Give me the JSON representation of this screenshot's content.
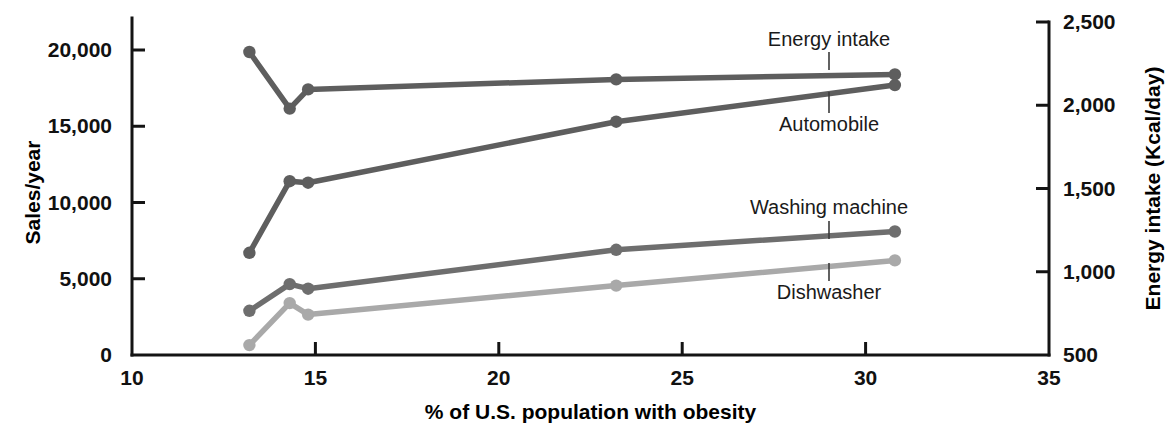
{
  "chart_data": {
    "type": "line",
    "title": "",
    "subtitle": "",
    "xlabel": "% of U.S. population with obesity",
    "ylabel": "Sales/year",
    "y2label": "Energy intake (Kcal/day)",
    "xlim": [
      10,
      35
    ],
    "ylim": [
      0,
      22000
    ],
    "y2lim": [
      500,
      2600
    ],
    "xticks": [
      "10",
      "15",
      "20",
      "25",
      "30",
      "35"
    ],
    "xtick_values": [
      10,
      15,
      20,
      25,
      30,
      35
    ],
    "yticks": [
      "0",
      "5,000",
      "10,000",
      "15,000",
      "20,000"
    ],
    "ytick_values": [
      0,
      5000,
      10000,
      15000,
      20000
    ],
    "y2ticks": [
      "500",
      "1,000",
      "1,500",
      "2,000",
      "2,500"
    ],
    "y2tick_values": [
      500,
      1000,
      1500,
      2000,
      2500
    ],
    "grid": false,
    "legend_position": "inline-annotations",
    "x": [
      13.2,
      14.3,
      14.8,
      23.2,
      30.8
    ],
    "series": [
      {
        "name": "Energy intake",
        "axis": "right",
        "color": "#5e5e5e",
        "label_x": 829,
        "label_y": 46,
        "label_anchor": "middle",
        "leader_from_y": 52,
        "leader_to_y": 70,
        "leader_x": 829,
        "values": [
          2320,
          1980,
          2095,
          2155,
          2185
        ]
      },
      {
        "name": "Automobile",
        "axis": "left",
        "color": "#5e5e5e",
        "label_x": 829,
        "label_y": 131,
        "label_anchor": "middle",
        "leader_from_y": 113,
        "leader_to_y": 92,
        "leader_x": 829,
        "values": [
          6700,
          11400,
          11300,
          15300,
          17700
        ]
      },
      {
        "name": "Washing machine",
        "axis": "left",
        "color": "#6e6e6e",
        "label_x": 829,
        "label_y": 214,
        "label_anchor": "middle",
        "leader_from_y": 221,
        "leader_to_y": 239,
        "leader_x": 829,
        "values": [
          2900,
          4650,
          4350,
          6900,
          8100
        ]
      },
      {
        "name": "Dishwasher",
        "axis": "left",
        "color": "#a9a9a9",
        "label_x": 829,
        "label_y": 299,
        "label_anchor": "middle",
        "leader_from_y": 281,
        "leader_to_y": 263,
        "leader_x": 829,
        "values": [
          650,
          3400,
          2650,
          4550,
          6200
        ]
      }
    ]
  }
}
